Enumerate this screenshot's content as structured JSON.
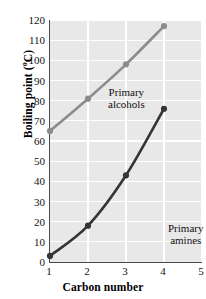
{
  "chart_data": {
    "type": "line",
    "title": "",
    "xlabel": "Carbon number",
    "ylabel": "Boiling point (°C)",
    "ylabel_main": "Boiling point (",
    "ylabel_unit": "o",
    "ylabel_tail": "C)",
    "x": [
      1,
      2,
      3,
      4
    ],
    "xlim": [
      1,
      5
    ],
    "ylim": [
      0,
      120
    ],
    "grid": true,
    "legend_position": "inline-annotations",
    "xticks": [
      "1",
      "2",
      "3",
      "4",
      "5"
    ],
    "yticks": [
      "120",
      "110",
      "100",
      "90",
      "80",
      "70",
      "60",
      "50",
      "40",
      "30",
      "20",
      "10",
      "0"
    ],
    "series": [
      {
        "name": "Primary alcohols",
        "color": "#8c8c8c",
        "values": [
          65,
          81,
          98,
          117
        ]
      },
      {
        "name": "Primary amines",
        "color": "#353535",
        "values": [
          3,
          18,
          43,
          76
        ]
      }
    ],
    "annotations": [
      {
        "id": "alcohols",
        "line1": "Primary",
        "line2": "alcohols"
      },
      {
        "id": "amines",
        "line1": "Primary",
        "line2": "amines"
      }
    ]
  },
  "colors": {
    "plot_background": "#e8e8e8",
    "gridline": "#ffffff",
    "axis": "#4a4a4a",
    "alcohols": "#8c8c8c",
    "amines": "#353535"
  }
}
